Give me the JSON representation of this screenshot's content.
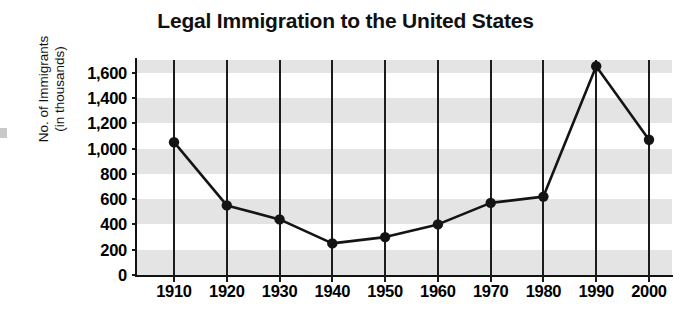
{
  "chart_data": {
    "type": "line",
    "title": "Legal Immigration to the United States",
    "xlabel": "",
    "ylabel": "No. of Immigrants (in thousands)",
    "ylabel_lines": [
      "No. of Immigrants",
      "(in thousands)"
    ],
    "categories": [
      "1910",
      "1920",
      "1930",
      "1940",
      "1950",
      "1960",
      "1970",
      "1980",
      "1990",
      "2000"
    ],
    "values": [
      1050,
      550,
      440,
      250,
      300,
      400,
      570,
      620,
      1650,
      1070
    ],
    "ylim": [
      0,
      1700
    ],
    "ytick_values": [
      0,
      200,
      400,
      600,
      800,
      1000,
      1200,
      1400,
      1600
    ],
    "ytick_labels": [
      "0",
      "200",
      "400",
      "600",
      "800",
      "1,000",
      "1,200",
      "1,400",
      "1,600"
    ],
    "grid": "horizontal-bands-and-vertical-lines",
    "legend": "none",
    "series": [
      {
        "name": "Legal immigrants",
        "marker": "filled-circle",
        "line_color": "#141414",
        "marker_color": "#141414",
        "values": [
          1050,
          550,
          440,
          250,
          300,
          400,
          570,
          620,
          1650,
          1070
        ]
      }
    ],
    "band_color": "#e4e4e4",
    "axis_color": "#121212",
    "band_ranges": [
      [
        0,
        200
      ],
      [
        400,
        600
      ],
      [
        800,
        1000
      ],
      [
        1200,
        1400
      ],
      [
        1600,
        1700
      ]
    ]
  }
}
